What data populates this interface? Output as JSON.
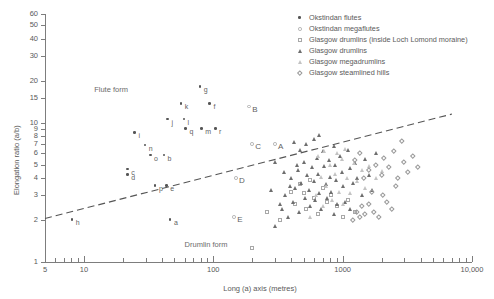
{
  "chart_data": {
    "type": "scatter",
    "title": "",
    "xlabel": "Long (a) axis (metres)",
    "ylabel": "Elongation ratio (a/b)",
    "xscale": "log",
    "yscale": "log",
    "xlim": [
      5,
      10000
    ],
    "ylim": [
      1,
      60
    ],
    "xticks": [
      5,
      10,
      100,
      1000,
      10000
    ],
    "xtick_labels": [
      "5",
      "10",
      "100",
      "1000",
      "10,000"
    ],
    "yticks": [
      1,
      2,
      3,
      4,
      5,
      6,
      7,
      8,
      9,
      10,
      15,
      20,
      30,
      40,
      50,
      60
    ],
    "ytick_labels": [
      "1",
      "2",
      "3",
      "4",
      "5",
      "6",
      "7",
      "8",
      "9",
      "10",
      "15",
      "20",
      "30",
      "40",
      "50",
      "60"
    ],
    "grid": false,
    "legend_position": "top-right",
    "annotations": [
      {
        "text": "Flute form",
        "x": 12,
        "y": 17.5
      },
      {
        "text": "Drumlin form",
        "x": 60,
        "y": 1.35
      }
    ],
    "reference_line": {
      "style": "dashed",
      "label": "flute / drumlin boundary",
      "points": [
        [
          5,
          2.05
        ],
        [
          7000,
          11.5
        ]
      ]
    },
    "series": [
      {
        "name": "Okstindan flutes",
        "marker": "filled-circle",
        "color": "#555555",
        "points": [
          {
            "label": "h",
            "x": 8.2,
            "y": 2.0
          },
          {
            "label": "c",
            "x": 22,
            "y": 4.6
          },
          {
            "label": "d",
            "x": 22,
            "y": 4.2
          },
          {
            "label": "i",
            "x": 25,
            "y": 8.4
          },
          {
            "label": "n",
            "x": 30,
            "y": 6.8
          },
          {
            "label": "o",
            "x": 33,
            "y": 5.8
          },
          {
            "label": "b",
            "x": 42,
            "y": 5.8
          },
          {
            "label": "p",
            "x": 36,
            "y": 3.5
          },
          {
            "label": "e",
            "x": 44,
            "y": 3.5
          },
          {
            "label": "a",
            "x": 47,
            "y": 2.0
          },
          {
            "label": "j",
            "x": 45,
            "y": 10.5
          },
          {
            "label": "k",
            "x": 57,
            "y": 13.5
          },
          {
            "label": "l",
            "x": 60,
            "y": 10.5
          },
          {
            "label": "q",
            "x": 62,
            "y": 9.0
          },
          {
            "label": "m",
            "x": 82,
            "y": 9.0
          },
          {
            "label": "r",
            "x": 105,
            "y": 9.0
          },
          {
            "label": "f",
            "x": 95,
            "y": 13.5
          },
          {
            "label": "g",
            "x": 80,
            "y": 18.0
          }
        ]
      },
      {
        "name": "Okstindan megaflutes",
        "marker": "open-circle",
        "color": "#b0b0b0",
        "points": [
          {
            "label": "A",
            "x": 300,
            "y": 7.0
          },
          {
            "label": "B",
            "x": 190,
            "y": 13.0
          },
          {
            "label": "C",
            "x": 200,
            "y": 7.0
          },
          {
            "label": "D",
            "x": 150,
            "y": 4.0
          },
          {
            "label": "E",
            "x": 145,
            "y": 2.1
          }
        ]
      },
      {
        "name": "Glasgow drumlins (inside Loch Lomond moraine)",
        "marker": "open-square",
        "color": "#a8a8a8",
        "points": [
          {
            "x": 200,
            "y": 1.25
          },
          {
            "x": 260,
            "y": 2.3
          },
          {
            "x": 330,
            "y": 2.0
          },
          {
            "x": 400,
            "y": 3.2
          },
          {
            "x": 430,
            "y": 2.6
          },
          {
            "x": 470,
            "y": 3.6
          },
          {
            "x": 500,
            "y": 3.1
          },
          {
            "x": 520,
            "y": 2.4
          },
          {
            "x": 560,
            "y": 3.9
          },
          {
            "x": 600,
            "y": 2.9
          },
          {
            "x": 640,
            "y": 2.2
          },
          {
            "x": 700,
            "y": 3.4
          },
          {
            "x": 760,
            "y": 2.7
          },
          {
            "x": 820,
            "y": 3.0
          },
          {
            "x": 900,
            "y": 2.5
          },
          {
            "x": 1000,
            "y": 2.1
          },
          {
            "x": 1100,
            "y": 2.8
          },
          {
            "x": 1250,
            "y": 2.3
          }
        ]
      },
      {
        "name": "Glasgow drumlins",
        "marker": "filled-triangle",
        "color": "#6e6e6e",
        "points": [
          {
            "x": 300,
            "y": 1.8
          },
          {
            "x": 340,
            "y": 2.4
          },
          {
            "x": 360,
            "y": 3.0
          },
          {
            "x": 380,
            "y": 2.1
          },
          {
            "x": 400,
            "y": 4.0
          },
          {
            "x": 410,
            "y": 2.7
          },
          {
            "x": 430,
            "y": 3.4
          },
          {
            "x": 450,
            "y": 4.6
          },
          {
            "x": 460,
            "y": 2.3
          },
          {
            "x": 480,
            "y": 3.7
          },
          {
            "x": 500,
            "y": 5.2
          },
          {
            "x": 510,
            "y": 2.9
          },
          {
            "x": 530,
            "y": 4.2
          },
          {
            "x": 550,
            "y": 3.3
          },
          {
            "x": 560,
            "y": 2.5
          },
          {
            "x": 580,
            "y": 4.8
          },
          {
            "x": 600,
            "y": 3.8
          },
          {
            "x": 610,
            "y": 2.8
          },
          {
            "x": 630,
            "y": 5.6
          },
          {
            "x": 650,
            "y": 4.3
          },
          {
            "x": 660,
            "y": 3.1
          },
          {
            "x": 680,
            "y": 2.4
          },
          {
            "x": 700,
            "y": 6.2
          },
          {
            "x": 720,
            "y": 4.9
          },
          {
            "x": 740,
            "y": 3.6
          },
          {
            "x": 760,
            "y": 2.9
          },
          {
            "x": 780,
            "y": 5.4
          },
          {
            "x": 800,
            "y": 4.1
          },
          {
            "x": 820,
            "y": 3.2
          },
          {
            "x": 850,
            "y": 6.8
          },
          {
            "x": 870,
            "y": 5.0
          },
          {
            "x": 890,
            "y": 3.9
          },
          {
            "x": 910,
            "y": 2.6
          },
          {
            "x": 950,
            "y": 5.8
          },
          {
            "x": 980,
            "y": 4.4
          },
          {
            "x": 1000,
            "y": 3.5
          },
          {
            "x": 1050,
            "y": 2.7
          },
          {
            "x": 1100,
            "y": 6.4
          },
          {
            "x": 1150,
            "y": 4.7
          },
          {
            "x": 1200,
            "y": 3.7
          },
          {
            "x": 1250,
            "y": 5.1
          },
          {
            "x": 1300,
            "y": 4.0
          },
          {
            "x": 1400,
            "y": 3.0
          },
          {
            "x": 1500,
            "y": 5.5
          },
          {
            "x": 1600,
            "y": 4.2
          },
          {
            "x": 1700,
            "y": 3.3
          },
          {
            "x": 1800,
            "y": 6.0
          },
          {
            "x": 420,
            "y": 7.2
          },
          {
            "x": 470,
            "y": 6.4
          },
          {
            "x": 520,
            "y": 7.0
          },
          {
            "x": 600,
            "y": 7.6
          },
          {
            "x": 440,
            "y": 5.0
          },
          {
            "x": 390,
            "y": 3.5
          },
          {
            "x": 350,
            "y": 4.4
          },
          {
            "x": 330,
            "y": 2.6
          },
          {
            "x": 660,
            "y": 8.2
          },
          {
            "x": 300,
            "y": 5.2
          },
          {
            "x": 860,
            "y": 2.2
          },
          {
            "x": 1150,
            "y": 2.4
          },
          {
            "x": 280,
            "y": 3.3
          }
        ]
      },
      {
        "name": "Glasgow megadrumlins",
        "marker": "light-triangle",
        "color": "#c3c3c3",
        "points": [
          {
            "x": 560,
            "y": 2.1
          },
          {
            "x": 620,
            "y": 3.0
          },
          {
            "x": 680,
            "y": 4.1
          },
          {
            "x": 700,
            "y": 2.5
          },
          {
            "x": 750,
            "y": 3.5
          },
          {
            "x": 800,
            "y": 5.0
          },
          {
            "x": 830,
            "y": 2.8
          },
          {
            "x": 880,
            "y": 4.3
          },
          {
            "x": 930,
            "y": 3.2
          },
          {
            "x": 980,
            "y": 5.5
          },
          {
            "x": 1000,
            "y": 2.6
          },
          {
            "x": 1080,
            "y": 4.0
          },
          {
            "x": 1150,
            "y": 3.1
          },
          {
            "x": 1220,
            "y": 5.1
          },
          {
            "x": 1300,
            "y": 3.8
          },
          {
            "x": 1400,
            "y": 4.6
          },
          {
            "x": 1500,
            "y": 3.4
          },
          {
            "x": 1600,
            "y": 4.9
          },
          {
            "x": 1800,
            "y": 4.0
          },
          {
            "x": 2000,
            "y": 4.5
          },
          {
            "x": 900,
            "y": 6.0
          },
          {
            "x": 1050,
            "y": 6.5
          },
          {
            "x": 640,
            "y": 5.8
          },
          {
            "x": 720,
            "y": 6.2
          }
        ]
      },
      {
        "name": "Glasgow steamlined hills",
        "marker": "open-diamond",
        "color": "#9a9a9a",
        "points": [
          {
            "x": 1200,
            "y": 2.0
          },
          {
            "x": 1300,
            "y": 2.3
          },
          {
            "x": 1350,
            "y": 2.1
          },
          {
            "x": 1400,
            "y": 2.5
          },
          {
            "x": 1500,
            "y": 2.2
          },
          {
            "x": 1600,
            "y": 2.6
          },
          {
            "x": 1750,
            "y": 2.3
          },
          {
            "x": 1900,
            "y": 2.1
          },
          {
            "x": 1450,
            "y": 4.0
          },
          {
            "x": 1600,
            "y": 4.6
          },
          {
            "x": 1800,
            "y": 5.0
          },
          {
            "x": 2000,
            "y": 4.2
          },
          {
            "x": 2100,
            "y": 5.6
          },
          {
            "x": 2300,
            "y": 4.8
          },
          {
            "x": 2500,
            "y": 6.2
          },
          {
            "x": 2600,
            "y": 3.5
          },
          {
            "x": 2900,
            "y": 7.4
          },
          {
            "x": 3000,
            "y": 5.2
          },
          {
            "x": 3200,
            "y": 4.4
          },
          {
            "x": 3500,
            "y": 5.8
          },
          {
            "x": 1700,
            "y": 3.2
          },
          {
            "x": 2200,
            "y": 2.7
          },
          {
            "x": 2400,
            "y": 2.4
          },
          {
            "x": 1250,
            "y": 5.4
          },
          {
            "x": 1350,
            "y": 6.0
          },
          {
            "x": 2700,
            "y": 4.0
          },
          {
            "x": 3800,
            "y": 4.8
          },
          {
            "x": 2050,
            "y": 3.0
          }
        ]
      }
    ]
  },
  "legend": {
    "items": [
      {
        "label": "Okstindan flutes",
        "marker": "filled-circle"
      },
      {
        "label": "Okstindan megaflutes",
        "marker": "open-circle"
      },
      {
        "label": "Glasgow drumlins (inside Loch Lomond moraine)",
        "marker": "open-square"
      },
      {
        "label": "Glasgow drumlins",
        "marker": "filled-triangle"
      },
      {
        "label": "Glasgow megadrumlins",
        "marker": "light-triangle"
      },
      {
        "label": "Glasgow steamlined hills",
        "marker": "open-diamond"
      }
    ]
  }
}
